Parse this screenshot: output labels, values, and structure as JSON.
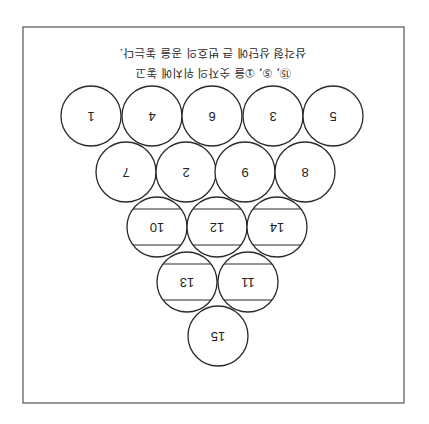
{
  "orientation": "rotated-180",
  "frame": {
    "x": 23,
    "y": 27,
    "width": 381,
    "height": 376,
    "stroke": "#555555"
  },
  "caption": {
    "line1": "⑮, ⑤, ①을 숫자의 위치에 놓고",
    "line2": "삼각형 상단에 큰 번호의 공을 놓는다."
  },
  "ball_radius": 30,
  "rows": [
    {
      "y": 116,
      "balls": [
        {
          "x": 91,
          "label": "1",
          "striped": false
        },
        {
          "x": 152,
          "label": "4",
          "striped": false
        },
        {
          "x": 212,
          "label": "6",
          "striped": false
        },
        {
          "x": 273,
          "label": "3",
          "striped": false
        },
        {
          "x": 333,
          "label": "5",
          "striped": false
        }
      ]
    },
    {
      "y": 172,
      "balls": [
        {
          "x": 126,
          "label": "7",
          "striped": false
        },
        {
          "x": 186,
          "label": "2",
          "striped": false
        },
        {
          "x": 245,
          "label": "9",
          "striped": false
        },
        {
          "x": 305,
          "label": "8",
          "striped": false
        }
      ]
    },
    {
      "y": 227,
      "balls": [
        {
          "x": 157,
          "label": "10",
          "striped": true
        },
        {
          "x": 217,
          "label": "12",
          "striped": true
        },
        {
          "x": 277,
          "label": "14",
          "striped": true
        }
      ]
    },
    {
      "y": 282,
      "balls": [
        {
          "x": 187,
          "label": "13",
          "striped": true
        },
        {
          "x": 248,
          "label": "11",
          "striped": true
        }
      ]
    },
    {
      "y": 336,
      "balls": [
        {
          "x": 218,
          "label": "15",
          "striped": false
        }
      ]
    }
  ]
}
